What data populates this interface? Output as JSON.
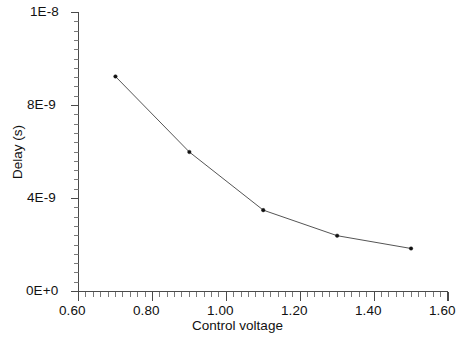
{
  "chart_data": {
    "type": "line",
    "title": "",
    "subtitle": "",
    "xlabel": "Control voltage",
    "ylabel": "Delay (s)",
    "xlim": [
      0.6,
      1.6
    ],
    "ylim": [
      0,
      1.2e-08
    ],
    "grid": false,
    "legend": null,
    "x_tick_labels": [
      "0.60",
      "0.80",
      "1.00",
      "1.20",
      "1.40",
      "1.60"
    ],
    "x_tick_values": [
      0.6,
      0.8,
      1.0,
      1.2,
      1.4,
      1.6
    ],
    "x_minor_step": 0.02,
    "y_tick_labels": [
      "1E-8",
      "8E-9",
      "4E-9",
      "0E+0"
    ],
    "y_tick_values": [
      1.2e-08,
      8e-09,
      4e-09,
      0
    ],
    "y_minor_step": 4e-10,
    "marker": "dot",
    "line_color": "#555555",
    "marker_color": "#111111",
    "axis_color": "#4a4a4a",
    "background_color": "#ffffff",
    "x": [
      0.7,
      0.9,
      1.1,
      1.3,
      1.5
    ],
    "values": [
      9.25e-09,
      6e-09,
      3.5e-09,
      2.4e-09,
      1.85e-09
    ],
    "series": [
      {
        "name": "Delay vs control voltage",
        "x": [
          0.7,
          0.9,
          1.1,
          1.3,
          1.5
        ],
        "values": [
          9.25e-09,
          6e-09,
          3.5e-09,
          2.4e-09,
          1.85e-09
        ]
      }
    ],
    "points": [
      {
        "x": "0.70",
        "y": "9.25E-9"
      },
      {
        "x": "0.90",
        "y": "6.0E-9"
      },
      {
        "x": "1.10",
        "y": "3.5E-9"
      },
      {
        "x": "1.30",
        "y": "2.4E-9"
      },
      {
        "x": "1.50",
        "y": "1.85E-9"
      }
    ]
  },
  "axes": {
    "x_title": "Control voltage",
    "y_title": "Delay (s)",
    "x_labels": {
      "t0": "0.60",
      "t1": "0.80",
      "t2": "1.00",
      "t3": "1.20",
      "t4": "1.40",
      "t5": "1.60"
    },
    "y_labels": {
      "t0": "1E-8",
      "t1": "8E-9",
      "t2": "4E-9",
      "t3": "0E+0"
    }
  }
}
